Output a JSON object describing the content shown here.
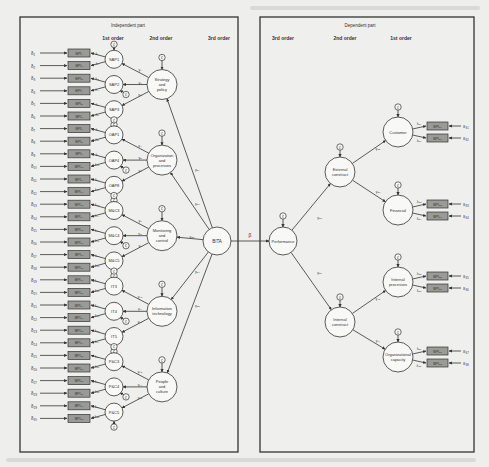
{
  "figure": {
    "left_panel": {
      "title": "Independent part",
      "order_labels": [
        "1st order",
        "2nd order",
        "3rd order"
      ],
      "third_order": {
        "label": "BITA",
        "path_label": "β"
      },
      "second_order": [
        {
          "label": "Strategy and policy",
          "lines": [
            "Strategy",
            "and",
            "policy"
          ],
          "gamma": "γ₃₁",
          "first_order": [
            {
              "label": "SAP1",
              "gamma": "γ₁",
              "indicators": [
                {
                  "delta": "δ₁",
                  "box": "BPI₁",
                  "lambda": "λ₁"
                },
                {
                  "delta": "δ₂",
                  "box": "BPI₂",
                  "lambda": "λ₂"
                }
              ]
            },
            {
              "label": "SAP2",
              "gamma": "γ₂",
              "indicators": [
                {
                  "delta": "δ₃",
                  "box": "BPI₃",
                  "lambda": "λ₃"
                },
                {
                  "delta": "δ₄",
                  "box": "BPI₄",
                  "lambda": "λ₄"
                }
              ]
            },
            {
              "label": "SAP3",
              "gamma": "γ₃",
              "indicators": [
                {
                  "delta": "δ₅",
                  "box": "BPI₅",
                  "lambda": "λ₅"
                },
                {
                  "delta": "δ₆",
                  "box": "BPI₆",
                  "lambda": "λ₆"
                }
              ]
            }
          ]
        },
        {
          "label": "Organization and processes",
          "lines": [
            "Organization",
            "and",
            "processes"
          ],
          "gamma": "γ₃₂",
          "first_order": [
            {
              "label": "OAP1",
              "gamma": "γ₄",
              "indicators": [
                {
                  "delta": "δ₇",
                  "box": "BPI₇",
                  "lambda": "λ₇"
                },
                {
                  "delta": "δ₈",
                  "box": "BPI₈",
                  "lambda": "λ₈"
                }
              ]
            },
            {
              "label": "OAP4",
              "gamma": "γ₅",
              "indicators": [
                {
                  "delta": "δ₉",
                  "box": "BPI₉",
                  "lambda": "λ₉"
                },
                {
                  "delta": "δ₁₀",
                  "box": "BPI₁₀",
                  "lambda": "λ₁₀"
                }
              ]
            },
            {
              "label": "OAP8",
              "gamma": "γ₆",
              "indicators": [
                {
                  "delta": "δ₁₁",
                  "box": "BPI₁₁",
                  "lambda": "λ₁₁"
                },
                {
                  "delta": "δ₁₂",
                  "box": "BPI₁₂",
                  "lambda": "λ₁₂"
                }
              ]
            }
          ]
        },
        {
          "label": "Monitoring and control",
          "lines": [
            "Monitoring",
            "and",
            "control"
          ],
          "gamma": "γ₃₃",
          "first_order": [
            {
              "label": "M&C3",
              "gamma": "γ₇",
              "indicators": [
                {
                  "delta": "δ₁₃",
                  "box": "BPI₁₃",
                  "lambda": "λ₁₃"
                },
                {
                  "delta": "δ₁₄",
                  "box": "BPI₁₄",
                  "lambda": "λ₁₄"
                }
              ]
            },
            {
              "label": "M&C4",
              "gamma": "γ₈",
              "indicators": [
                {
                  "delta": "δ₁₅",
                  "box": "BPI₁₅",
                  "lambda": "λ₁₅"
                },
                {
                  "delta": "δ₁₆",
                  "box": "BPI₁₆",
                  "lambda": "λ₁₆"
                }
              ]
            },
            {
              "label": "M&C5",
              "gamma": "γ₉",
              "indicators": [
                {
                  "delta": "δ₁₇",
                  "box": "BPI₁₇",
                  "lambda": "λ₁₇"
                },
                {
                  "delta": "δ₁₈",
                  "box": "BPI₁₈",
                  "lambda": "λ₁₈"
                }
              ]
            }
          ]
        },
        {
          "label": "Information technology",
          "lines": [
            "Information",
            "technology"
          ],
          "gamma": "γ₃₄",
          "first_order": [
            {
              "label": "IT3",
              "gamma": "γ₁₀",
              "indicators": [
                {
                  "delta": "δ₁₉",
                  "box": "BPI₁₉",
                  "lambda": "λ₁₉"
                },
                {
                  "delta": "δ₂₀",
                  "box": "BPI₂₀",
                  "lambda": "λ₂₀"
                }
              ]
            },
            {
              "label": "IT4",
              "gamma": "γ₁₁",
              "indicators": [
                {
                  "delta": "δ₂₁",
                  "box": "BPI₂₁",
                  "lambda": "λ₂₁"
                },
                {
                  "delta": "δ₂₂",
                  "box": "BPI₂₂",
                  "lambda": "λ₂₂"
                }
              ]
            },
            {
              "label": "IT5",
              "gamma": "γ₁₂",
              "indicators": [
                {
                  "delta": "δ₂₃",
                  "box": "BPI₂₃",
                  "lambda": "λ₂₃"
                },
                {
                  "delta": "δ₂₄",
                  "box": "BPI₂₄",
                  "lambda": "λ₂₄"
                }
              ]
            }
          ]
        },
        {
          "label": "People and culture",
          "lines": [
            "People",
            "and",
            "culture"
          ],
          "gamma": "γ₃₅",
          "first_order": [
            {
              "label": "P&C3",
              "gamma": "γ₁₃",
              "indicators": [
                {
                  "delta": "δ₂₅",
                  "box": "BPI₂₅",
                  "lambda": "λ₂₅"
                },
                {
                  "delta": "δ₂₆",
                  "box": "BPI₂₆",
                  "lambda": "λ₂₆"
                }
              ]
            },
            {
              "label": "P&C4",
              "gamma": "γ₁₄",
              "indicators": [
                {
                  "delta": "δ₂₇",
                  "box": "BPI₂₇",
                  "lambda": "λ₂₇"
                },
                {
                  "delta": "δ₂₈",
                  "box": "BPI₂₈",
                  "lambda": "λ₂₈"
                }
              ]
            },
            {
              "label": "P&C5",
              "gamma": "γ₁₅",
              "indicators": [
                {
                  "delta": "δ₂₉",
                  "box": "BPI₂₉",
                  "lambda": "λ₂₉"
                },
                {
                  "delta": "δ₃₀",
                  "box": "BPI₃₀",
                  "lambda": "λ₃₀"
                }
              ]
            }
          ]
        }
      ]
    },
    "right_panel": {
      "title": "Dependent part",
      "order_labels": [
        "3rd order",
        "2nd order",
        "1st order"
      ],
      "third_order": {
        "label": "Performance"
      },
      "second_order": [
        {
          "label": "External construct",
          "lines": [
            "External",
            "construct"
          ],
          "gamma": "γ₃₆",
          "first_order": [
            {
              "label": "Customer",
              "lines": [
                "Customer"
              ],
              "gamma": "γ₃₈",
              "indicators": [
                {
                  "eps": "ε₃₁",
                  "box": "BPI₃₁",
                  "lambda": "λ₃₁"
                },
                {
                  "eps": "ε₃₂",
                  "box": "BPI₃₂",
                  "lambda": "λ₃₂"
                }
              ]
            },
            {
              "label": "Financial",
              "lines": [
                "Financial"
              ],
              "gamma": "γ₃₉",
              "indicators": [
                {
                  "eps": "ε₃₃",
                  "box": "BPI₃₃",
                  "lambda": "λ₃₃"
                },
                {
                  "eps": "ε₃₄",
                  "box": "BPI₃₄",
                  "lambda": "λ₃₄"
                }
              ]
            }
          ]
        },
        {
          "label": "Internal construct",
          "lines": [
            "Internal",
            "construct"
          ],
          "gamma": "γ₃₇",
          "first_order": [
            {
              "label": "Internal processes",
              "lines": [
                "Internal",
                "processes"
              ],
              "gamma": "γ₄₀",
              "indicators": [
                {
                  "eps": "ε₃₅",
                  "box": "BPI₃₅",
                  "lambda": "λ₃₅"
                },
                {
                  "eps": "ε₃₆",
                  "box": "BPI₃₆",
                  "lambda": "λ₃₆"
                }
              ]
            },
            {
              "label": "Organizational capacity",
              "lines": [
                "Organizational",
                "capacity"
              ],
              "gamma": "γ₄₁",
              "indicators": [
                {
                  "eps": "ε₃₇",
                  "box": "BPI₃₇",
                  "lambda": "λ₃₇"
                },
                {
                  "eps": "ε₃₈",
                  "box": "BPI₃₈",
                  "lambda": "λ₃₈"
                }
              ]
            }
          ]
        }
      ]
    },
    "disturbance_symbol": "ζ"
  }
}
